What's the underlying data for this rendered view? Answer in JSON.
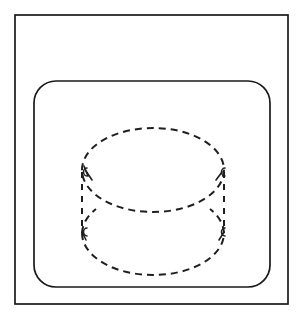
{
  "figure": {
    "style": "patent-line-drawing",
    "background_color": "#ffffff",
    "line_color": "#1a1a1a",
    "hidden_line_color": "#1f1f1f",
    "canvas": {
      "width": 303,
      "height": 321
    }
  },
  "outer_frame": {
    "name": "outer-rectangle",
    "label": "",
    "shape": "rectangle",
    "corners": "sharp",
    "x": 15,
    "y": 15,
    "width": 273,
    "height": 289,
    "stroke_width": 1.7
  },
  "inner_panel": {
    "name": "inner-rounded-rectangle",
    "label": "",
    "shape": "rounded-rectangle",
    "corners": "rounded",
    "x": 34,
    "y": 81,
    "width": 236,
    "height": 206,
    "corner_radius": 22,
    "stroke_width": 1.7
  },
  "cylinder": {
    "name": "dashed-cylinder",
    "label": "",
    "line_style": "dashed",
    "dash_length": 7,
    "gap_length": 5,
    "stroke_width": 2.0,
    "center_x": 153,
    "top_ellipse": {
      "cx": 153,
      "cy": 170,
      "rx": 71,
      "ry": 42
    },
    "bottom_ellipse": {
      "cx": 153,
      "cy": 233,
      "rx": 71,
      "ry": 42
    },
    "left_side_x": 82,
    "right_side_x": 224,
    "side_top_y": 170,
    "side_bottom_y": 233
  },
  "tick_marks": [
    {
      "name": "tick-top-left",
      "x": 84,
      "y": 172,
      "glyph": "c"
    },
    {
      "name": "tick-top-right",
      "x": 222,
      "y": 172,
      "glyph": "c"
    },
    {
      "name": "tick-bottom-left",
      "x": 84,
      "y": 232,
      "glyph": "c"
    },
    {
      "name": "tick-bottom-right",
      "x": 222,
      "y": 232,
      "glyph": "c"
    }
  ]
}
